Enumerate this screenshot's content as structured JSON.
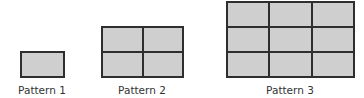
{
  "patterns": [
    {
      "label": "Pattern 1",
      "rows": 1,
      "cols": 1
    },
    {
      "label": "Pattern 2",
      "rows": 2,
      "cols": 2
    },
    {
      "label": "Pattern 3",
      "rows": 3,
      "cols": 3
    }
  ],
  "colors": {
    "fill": "#cfcfcf",
    "stroke": "#2e2e2e"
  }
}
